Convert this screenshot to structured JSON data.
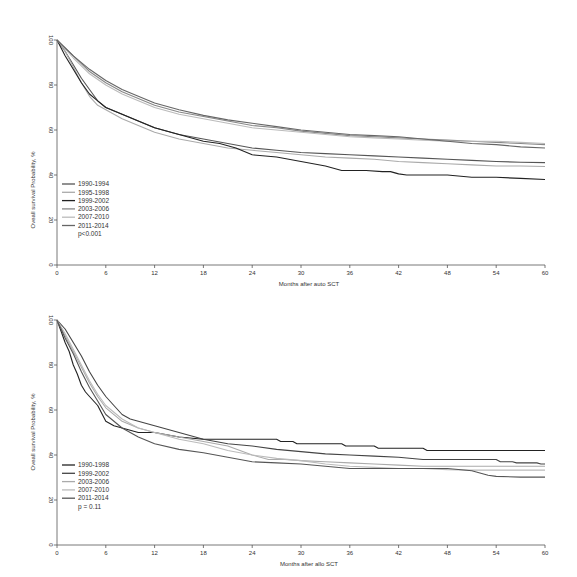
{
  "chart_data": [
    {
      "type": "line",
      "title": "",
      "xlabel": "Months after auto SCT",
      "ylabel": "Oveall survival Probability, %",
      "xlim": [
        0,
        60
      ],
      "ylim": [
        0,
        100
      ],
      "xticks": [
        0,
        6,
        12,
        18,
        24,
        30,
        36,
        42,
        48,
        54,
        60
      ],
      "yticks": [
        0,
        20,
        40,
        60,
        80,
        100
      ],
      "grid": false,
      "legend_position": "lower-left",
      "annotation": "p<0.001",
      "series": [
        {
          "name": "1990-1994",
          "color": "#555555",
          "x": [
            0,
            1,
            2,
            3,
            4,
            5,
            6,
            8,
            10,
            12,
            15,
            18,
            21,
            24,
            27,
            30,
            33,
            36,
            39,
            42,
            45,
            48,
            51,
            54,
            57,
            60
          ],
          "values": [
            100,
            95,
            89,
            83,
            78,
            73,
            70,
            67,
            64,
            61,
            58,
            56,
            54,
            52,
            51,
            50,
            49.5,
            49,
            48.5,
            48,
            47.5,
            47,
            46.5,
            46,
            45.7,
            45.5
          ]
        },
        {
          "name": "1995-1998",
          "color": "#aaaaaa",
          "x": [
            0,
            1,
            2,
            3,
            4,
            5,
            6,
            8,
            10,
            12,
            15,
            18,
            21,
            24,
            27,
            30,
            33,
            36,
            39,
            42,
            45,
            48,
            51,
            54,
            57,
            60
          ],
          "values": [
            100,
            95,
            88,
            81,
            75,
            71,
            69,
            65,
            62,
            59,
            56,
            54,
            52,
            51,
            50,
            49,
            48,
            47.5,
            47,
            46,
            45.5,
            45,
            44.5,
            44,
            44,
            43.8
          ]
        },
        {
          "name": "1999-2002",
          "color": "#222222",
          "x": [
            0,
            1,
            2,
            3,
            4,
            5,
            6,
            8,
            10,
            12,
            15,
            18,
            20,
            22,
            24,
            27,
            30,
            33,
            35,
            38,
            40,
            41,
            42,
            43,
            45,
            48,
            51,
            54,
            57,
            60
          ],
          "values": [
            100,
            93,
            87,
            81,
            76,
            73,
            70,
            67,
            64,
            61,
            58,
            55,
            54,
            52,
            49,
            48,
            46,
            44,
            42,
            42,
            41.5,
            41.5,
            40.5,
            40,
            40,
            40,
            39,
            39,
            38.5,
            38
          ]
        },
        {
          "name": "2003-2006",
          "color": "#888888",
          "x": [
            0,
            2,
            4,
            6,
            8,
            10,
            12,
            15,
            18,
            21,
            24,
            27,
            30,
            33,
            36,
            39,
            42,
            45,
            48,
            51,
            54,
            57,
            60
          ],
          "values": [
            100,
            93,
            86,
            81,
            77,
            74,
            71,
            68,
            66,
            64,
            62,
            61,
            59.5,
            58.5,
            57.5,
            57,
            56.5,
            56,
            55.5,
            55,
            54.5,
            54,
            53.5
          ]
        },
        {
          "name": "2007-2010",
          "color": "#bbbbbb",
          "x": [
            0,
            2,
            4,
            6,
            8,
            10,
            12,
            15,
            18,
            21,
            24,
            27,
            30,
            33,
            36,
            39,
            42,
            45,
            48,
            51,
            54,
            57,
            60
          ],
          "values": [
            100,
            92,
            85,
            80,
            76,
            73,
            70,
            67,
            65,
            63,
            61,
            60,
            59,
            58,
            57,
            56.5,
            56,
            55.5,
            55,
            55,
            55,
            54.5,
            54
          ]
        },
        {
          "name": "2011-2014",
          "color": "#666666",
          "x": [
            0,
            2,
            4,
            6,
            8,
            10,
            12,
            15,
            18,
            21,
            24,
            27,
            30,
            33,
            36,
            39,
            42,
            45,
            48,
            51,
            54,
            57,
            60
          ],
          "values": [
            100,
            93,
            87,
            82,
            78,
            75,
            72,
            69,
            66.5,
            64.5,
            63,
            61.5,
            60,
            59,
            58,
            57.5,
            57,
            56,
            55,
            54,
            53.5,
            52.5,
            52
          ]
        }
      ]
    },
    {
      "type": "line",
      "title": "",
      "xlabel": "Months after allo SCT",
      "ylabel": "Oveall survival Probability, %",
      "xlim": [
        0,
        60
      ],
      "ylim": [
        0,
        100
      ],
      "xticks": [
        0,
        6,
        12,
        18,
        24,
        30,
        36,
        42,
        48,
        54,
        60
      ],
      "yticks": [
        0,
        20,
        40,
        60,
        80,
        100
      ],
      "grid": false,
      "legend_position": "lower-left",
      "annotation": "p = 0.11",
      "series": [
        {
          "name": "1990-1998",
          "color": "#222222",
          "x": [
            0,
            0.5,
            1,
            1.5,
            2,
            2.5,
            3,
            3.5,
            4,
            5,
            6,
            7,
            8,
            9,
            10,
            12,
            15,
            18,
            21,
            24,
            27,
            27.5,
            29,
            29.5,
            35,
            35.5,
            39,
            39.5,
            45,
            45.5,
            60
          ],
          "values": [
            100,
            95,
            90,
            86,
            80,
            76,
            71,
            68,
            66,
            62,
            55,
            53,
            52,
            51,
            50,
            50,
            48,
            47,
            47,
            47,
            47,
            46,
            46,
            45,
            45,
            44,
            44,
            43,
            43,
            42,
            42
          ]
        },
        {
          "name": "1999-2002",
          "color": "#444444",
          "x": [
            0,
            1,
            2,
            3,
            4,
            5,
            6,
            7,
            8,
            9,
            10,
            12,
            15,
            18,
            21,
            24,
            27,
            30,
            33,
            36,
            39,
            42,
            45,
            48,
            51,
            54,
            54.5,
            56,
            56.5,
            59,
            59.5,
            60
          ],
          "values": [
            100,
            96,
            90,
            84,
            77,
            71,
            66,
            62,
            58,
            56,
            55,
            53,
            50,
            47,
            45,
            44,
            42.5,
            41.5,
            40.5,
            40,
            39.5,
            39,
            38,
            38,
            38,
            38,
            37,
            37,
            36.5,
            36.5,
            36,
            36
          ]
        },
        {
          "name": "2003-2006",
          "color": "#aaaaaa",
          "x": [
            0,
            1,
            2,
            3,
            4,
            5,
            6,
            8,
            10,
            12,
            15,
            18,
            21,
            24,
            26,
            28,
            30,
            33,
            36,
            39,
            42,
            45,
            48,
            51,
            54,
            57,
            60
          ],
          "values": [
            100,
            93,
            86,
            79,
            72,
            66,
            61,
            55,
            52,
            50,
            48,
            46,
            44,
            40,
            38,
            38,
            37.5,
            37,
            36.5,
            36,
            35.5,
            35,
            35,
            35,
            35,
            35,
            35
          ]
        },
        {
          "name": "2007-2010",
          "color": "#bbbbbb",
          "x": [
            0,
            1,
            2,
            3,
            4,
            5,
            6,
            8,
            10,
            12,
            15,
            18,
            21,
            24,
            27,
            30,
            33,
            36,
            39,
            42,
            45,
            48,
            51,
            54,
            57,
            60
          ],
          "values": [
            100,
            94,
            87,
            80,
            73,
            67,
            62,
            56,
            52,
            50,
            47,
            45,
            42,
            40,
            38.5,
            37.5,
            36,
            35,
            34.5,
            34,
            34,
            33.5,
            33.3,
            33.3,
            33.3,
            33.3
          ]
        },
        {
          "name": "2011-2014",
          "color": "#555555",
          "x": [
            0,
            1,
            2,
            3,
            4,
            5,
            6,
            8,
            10,
            12,
            15,
            18,
            21,
            24,
            27,
            30,
            33,
            36,
            39,
            42,
            45,
            48,
            51,
            52,
            53,
            54,
            57,
            60
          ],
          "values": [
            100,
            92,
            85,
            77,
            70,
            64,
            58,
            52,
            48,
            45,
            42.5,
            41,
            39,
            37,
            36.5,
            36,
            35,
            34,
            34,
            34,
            34,
            34,
            33,
            32,
            31,
            30.5,
            30.2,
            30.2
          ]
        }
      ]
    }
  ]
}
